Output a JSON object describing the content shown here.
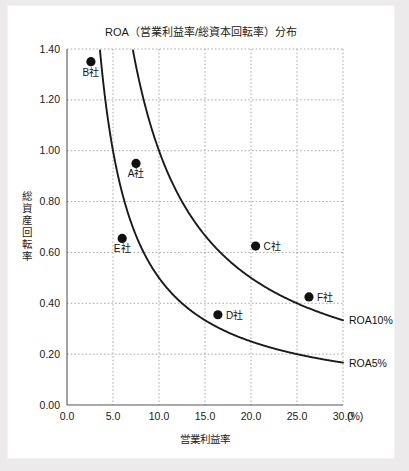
{
  "chart_data": {
    "type": "scatter",
    "title": "ROA（営業利益率/総資本回転率）分布",
    "xlabel": "営業利益率",
    "ylabel": "総資産回転率",
    "xunit": "(%)",
    "xlim": [
      0.0,
      30.0
    ],
    "ylim": [
      0.0,
      1.4
    ],
    "xticks": [
      "0.0",
      "5.0",
      "10.0",
      "15.0",
      "20.0",
      "25.0",
      "30.0"
    ],
    "xtick_values": [
      0.0,
      5.0,
      10.0,
      15.0,
      20.0,
      25.0,
      30.0
    ],
    "yticks": [
      "0.00",
      "0.20",
      "0.40",
      "0.60",
      "0.80",
      "1.00",
      "1.20",
      "1.40"
    ],
    "ytick_values": [
      0.0,
      0.2,
      0.4,
      0.6,
      0.8,
      1.0,
      1.2,
      1.4
    ],
    "grid": true,
    "grid_style": "dotted",
    "grid_color": "#9a9a9a",
    "legend": "none",
    "point_color": "#111111",
    "curve_color": "#1a1a1a",
    "points": [
      {
        "label": "A社",
        "x": 7.5,
        "y": 0.95,
        "label_dx": 0,
        "label_dy": 14,
        "label_anchor": "middle"
      },
      {
        "label": "B社",
        "x": 2.6,
        "y": 1.35,
        "label_dx": 0,
        "label_dy": 14,
        "label_anchor": "middle"
      },
      {
        "label": "C社",
        "x": 20.5,
        "y": 0.625,
        "label_dx": 8,
        "label_dy": 4,
        "label_anchor": "start"
      },
      {
        "label": "D社",
        "x": 16.4,
        "y": 0.355,
        "label_dx": 8,
        "label_dy": 4,
        "label_anchor": "start"
      },
      {
        "label": "E社",
        "x": 6.0,
        "y": 0.655,
        "label_dx": 0,
        "label_dy": 14,
        "label_anchor": "middle"
      },
      {
        "label": "F社",
        "x": 26.3,
        "y": 0.425,
        "label_dx": 8,
        "label_dy": 4,
        "label_anchor": "start"
      }
    ],
    "curves": [
      {
        "name": "ROA10%",
        "roa": 10,
        "label": "ROA10%",
        "label_x": 30.0,
        "label_y": 0.3333
      },
      {
        "name": "ROA5%",
        "roa": 5,
        "label": "ROA5%",
        "label_x": 30.0,
        "label_y": 0.1667
      }
    ]
  }
}
